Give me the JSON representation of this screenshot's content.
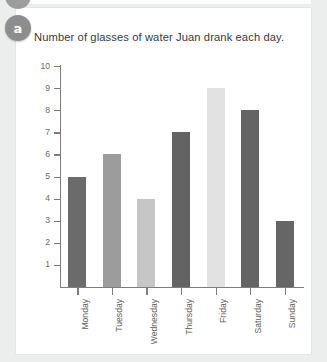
{
  "badge": {
    "label": "a",
    "color": "#8d8d8d"
  },
  "card": {
    "background": "#ffffff"
  },
  "page": {
    "background": "#eceded"
  },
  "chart_data": {
    "type": "bar",
    "title": "Number of glasses of water Juan drank each day.",
    "xlabel": "",
    "ylabel": "",
    "categories": [
      "Monday",
      "Tuesday",
      "Wednesday",
      "Thursday",
      "Friday",
      "Saturday",
      "Sunday"
    ],
    "values": [
      5,
      6,
      4,
      7,
      9,
      8,
      3
    ],
    "bar_colors": [
      "#6b6b6b",
      "#9c9c9c",
      "#c6c6c6",
      "#636363",
      "#e2e2e2",
      "#646464",
      "#666666"
    ],
    "ylim": [
      0,
      10
    ],
    "y_ticks": [
      10,
      9,
      8,
      7,
      6,
      5,
      4,
      3,
      2,
      1
    ],
    "y_tick_labels": [
      "10",
      "9",
      "8",
      "7",
      "6",
      "5",
      "4",
      "3",
      "2",
      "1"
    ],
    "grid": false,
    "legend": null,
    "axis_color": "#7d7d7d",
    "tick_label_color": "#6a6a6a"
  }
}
